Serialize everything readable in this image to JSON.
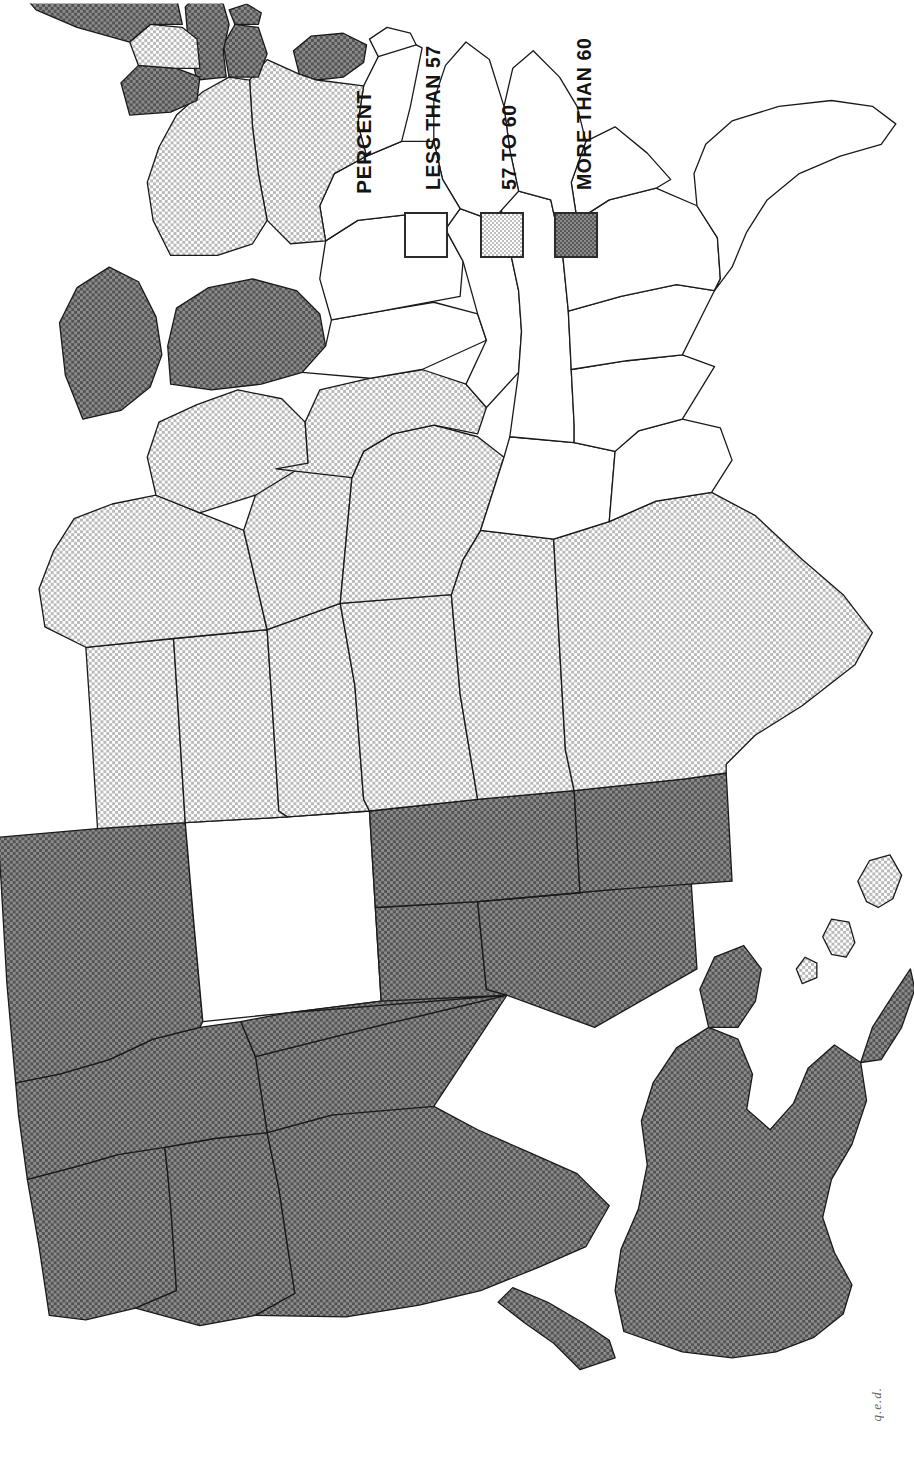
{
  "figure": {
    "kind": "choropleth-map",
    "orientation": "rotated-90-counterclockwise",
    "region": "United States including Alaska and Hawaii",
    "annotation": "q.e.d."
  },
  "legend": {
    "title": "PERCENT",
    "classes": [
      {
        "label": "LESS THAN 57",
        "swatch": "white",
        "color": "#ffffff",
        "key": "low"
      },
      {
        "label": "57 TO 60",
        "swatch": "light-gray",
        "color": "#d8d8d8",
        "key": "mid"
      },
      {
        "label": "MORE THAN 60",
        "swatch": "dark-gray",
        "color": "#6a6a6a",
        "key": "high"
      }
    ]
  },
  "map_data": {
    "type": "choropleth",
    "unit": "percent",
    "breaks": [
      57,
      60
    ],
    "class_names": [
      "LESS THAN 57",
      "57 TO 60",
      "MORE THAN 60"
    ],
    "states": [
      {
        "code": "WA",
        "name": "Washington",
        "class": "high"
      },
      {
        "code": "OR",
        "name": "Oregon",
        "class": "high"
      },
      {
        "code": "CA",
        "name": "California",
        "class": "high"
      },
      {
        "code": "NV",
        "name": "Nevada",
        "class": "high"
      },
      {
        "code": "ID",
        "name": "Idaho",
        "class": "high"
      },
      {
        "code": "MT",
        "name": "Montana",
        "class": "high"
      },
      {
        "code": "WY",
        "name": "Wyoming",
        "class": "low"
      },
      {
        "code": "UT",
        "name": "Utah",
        "class": "high"
      },
      {
        "code": "AZ",
        "name": "Arizona",
        "class": "high"
      },
      {
        "code": "CO",
        "name": "Colorado",
        "class": "high"
      },
      {
        "code": "NM",
        "name": "New Mexico",
        "class": "high"
      },
      {
        "code": "ND",
        "name": "North Dakota",
        "class": "mid"
      },
      {
        "code": "SD",
        "name": "South Dakota",
        "class": "mid"
      },
      {
        "code": "NE",
        "name": "Nebraska",
        "class": "mid"
      },
      {
        "code": "KS",
        "name": "Kansas",
        "class": "mid"
      },
      {
        "code": "OK",
        "name": "Oklahoma",
        "class": "mid"
      },
      {
        "code": "TX",
        "name": "Texas",
        "class": "mid"
      },
      {
        "code": "MN",
        "name": "Minnesota",
        "class": "mid"
      },
      {
        "code": "IA",
        "name": "Iowa",
        "class": "mid"
      },
      {
        "code": "MO",
        "name": "Missouri",
        "class": "mid"
      },
      {
        "code": "AR",
        "name": "Arkansas",
        "class": "low"
      },
      {
        "code": "LA",
        "name": "Louisiana",
        "class": "low"
      },
      {
        "code": "WI",
        "name": "Wisconsin",
        "class": "mid"
      },
      {
        "code": "IL",
        "name": "Illinois",
        "class": "mid"
      },
      {
        "code": "MI",
        "name": "Michigan",
        "class": "high"
      },
      {
        "code": "IN",
        "name": "Indiana",
        "class": "low"
      },
      {
        "code": "OH",
        "name": "Ohio",
        "class": "low"
      },
      {
        "code": "KY",
        "name": "Kentucky",
        "class": "low"
      },
      {
        "code": "TN",
        "name": "Tennessee",
        "class": "low"
      },
      {
        "code": "MS",
        "name": "Mississippi",
        "class": "low"
      },
      {
        "code": "AL",
        "name": "Alabama",
        "class": "low"
      },
      {
        "code": "GA",
        "name": "Georgia",
        "class": "low"
      },
      {
        "code": "FL",
        "name": "Florida",
        "class": "low"
      },
      {
        "code": "SC",
        "name": "South Carolina",
        "class": "low"
      },
      {
        "code": "NC",
        "name": "North Carolina",
        "class": "low"
      },
      {
        "code": "VA",
        "name": "Virginia",
        "class": "low"
      },
      {
        "code": "WV",
        "name": "West Virginia",
        "class": "low"
      },
      {
        "code": "MD",
        "name": "Maryland",
        "class": "low"
      },
      {
        "code": "DE",
        "name": "Delaware",
        "class": "low"
      },
      {
        "code": "NJ",
        "name": "New Jersey",
        "class": "high"
      },
      {
        "code": "PA",
        "name": "Pennsylvania",
        "class": "mid"
      },
      {
        "code": "NY",
        "name": "New York",
        "class": "mid"
      },
      {
        "code": "CT",
        "name": "Connecticut",
        "class": "high"
      },
      {
        "code": "RI",
        "name": "Rhode Island",
        "class": "high"
      },
      {
        "code": "MA",
        "name": "Massachusetts",
        "class": "high"
      },
      {
        "code": "VT",
        "name": "Vermont",
        "class": "high"
      },
      {
        "code": "NH",
        "name": "New Hampshire",
        "class": "mid"
      },
      {
        "code": "ME",
        "name": "Maine",
        "class": "high"
      },
      {
        "code": "AK",
        "name": "Alaska",
        "class": "high"
      },
      {
        "code": "HI",
        "name": "Hawaii",
        "class": "mid"
      }
    ]
  }
}
